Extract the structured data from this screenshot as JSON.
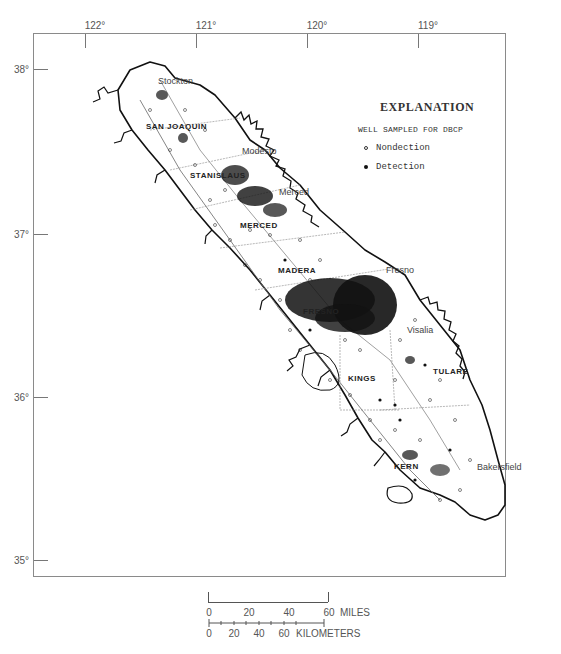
{
  "map": {
    "type": "map",
    "subject": "Wells sampled for DBCP, San Joaquin Valley",
    "longitude_labels": [
      {
        "label": "122°",
        "x": 95
      },
      {
        "label": "121°",
        "x": 206
      },
      {
        "label": "120°",
        "x": 317
      },
      {
        "label": "119°",
        "x": 428
      }
    ],
    "latitude_labels": [
      {
        "label": "38°",
        "y": 69
      },
      {
        "label": "37°",
        "y": 234
      },
      {
        "label": "36°",
        "y": 397
      },
      {
        "label": "35°",
        "y": 560
      }
    ],
    "places": [
      {
        "name": "Stockton",
        "x": 158,
        "y": 82
      },
      {
        "name": "Modesto",
        "x": 242,
        "y": 152
      },
      {
        "name": "Merced",
        "x": 279,
        "y": 193
      },
      {
        "name": "Fresno",
        "x": 386,
        "y": 271
      },
      {
        "name": "Visalia",
        "x": 407,
        "y": 331
      },
      {
        "name": "Bakersfield",
        "x": 477,
        "y": 468
      }
    ],
    "counties": [
      {
        "name": "SAN JOAQUIN",
        "x": 146,
        "y": 127
      },
      {
        "name": "STANISLAUS",
        "x": 190,
        "y": 176
      },
      {
        "name": "MERCED",
        "x": 240,
        "y": 226
      },
      {
        "name": "MADERA",
        "x": 278,
        "y": 271
      },
      {
        "name": "FRESNO",
        "x": 303,
        "y": 312
      },
      {
        "name": "KINGS",
        "x": 348,
        "y": 379
      },
      {
        "name": "TULARE",
        "x": 433,
        "y": 372
      },
      {
        "name": "KERN",
        "x": 394,
        "y": 467
      }
    ]
  },
  "legend": {
    "title": "EXPLANATION",
    "subtitle": "WELL SAMPLED FOR DBCP",
    "items": [
      {
        "symbol": "open-circle",
        "label": "Nondection"
      },
      {
        "symbol": "filled-circle",
        "label": "Detection"
      }
    ]
  },
  "scale_bar": {
    "miles": {
      "ticks": [
        "0",
        "20",
        "40",
        "60"
      ],
      "unit": "MILES"
    },
    "kilometers": {
      "ticks": [
        "0",
        "20",
        "40",
        "60"
      ],
      "unit": "KILOMETERS"
    }
  }
}
